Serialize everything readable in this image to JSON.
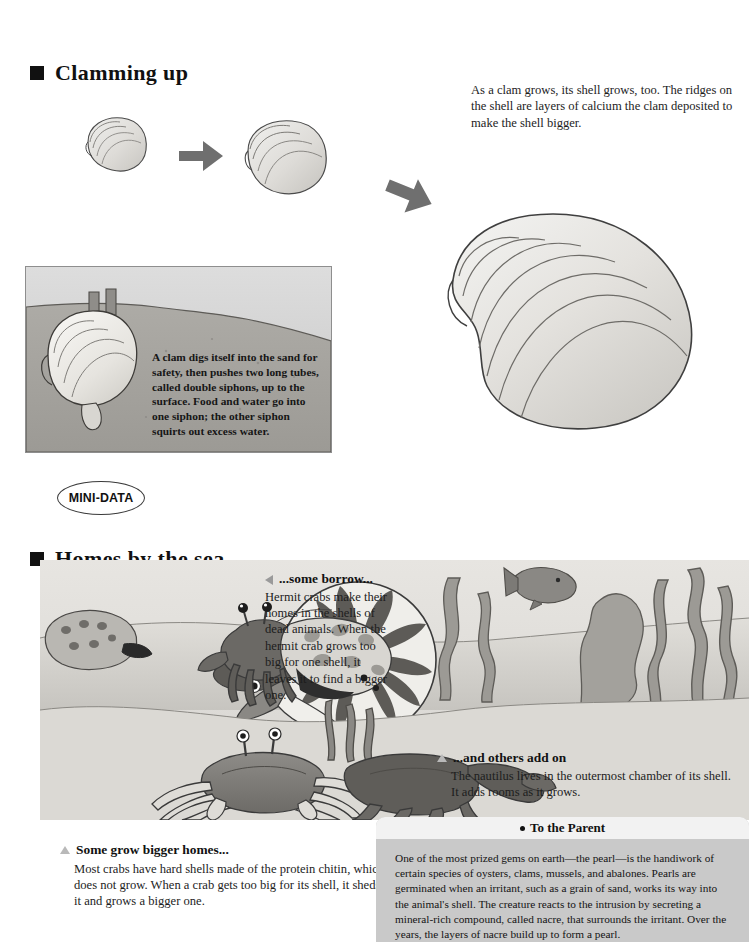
{
  "sections": {
    "clamming": {
      "title": "Clamming up",
      "bullet_icon": "square-bullet",
      "description": "As a clam grows, its shell grows, too. The ridges on the shell are layers of calcium the clam deposited to make the shell bigger.",
      "sand_caption": "A clam digs itself into the sand for safety, then pushes two long tubes, called double siphons, up to the surface. Food and water go into one siphon; the other siphon squirts out excess water."
    },
    "mini_data": {
      "label": "MINI-DATA"
    },
    "homes": {
      "title": "Homes by the sea",
      "bullet_icon": "square-bullet",
      "callouts": [
        {
          "marker": "triangle-left",
          "head": "...some borrow...",
          "body": "Hermit crabs make their homes in the shells of dead animals. When the hermit crab grows too big for one shell, it leaves it to find a bigger one."
        },
        {
          "marker": "triangle-up",
          "head": "...and others add on",
          "body": "The nautilus lives in the outermost chamber of its shell. It adds rooms as it grows."
        },
        {
          "marker": "triangle-up",
          "head": "Some grow bigger homes...",
          "body": "Most crabs have hard shells made of the protein chitin, which does not grow. When a crab gets too big for its shell, it sheds it and grows a bigger one."
        }
      ]
    },
    "parent": {
      "title": "To the Parent",
      "bullet_icon": "dot-bullet",
      "body": "One of the most prized gems on earth—the pearl—is the handiwork of certain species of oysters, clams, mussels, and abalones. Pearls are germinated when an irritant, such as a grain of sand, works its way into the animal's shell. The creature reacts to the intrusion by secreting a mineral-rich compound, called nacre, that surrounds the irritant. Over the years, the layers of nacre build up to form a pearl."
    }
  },
  "illustrations": {
    "clam_small": "small-clam-shell",
    "clam_medium": "medium-clam-shell",
    "clam_large": "large-clam-shell",
    "arrow_1": "arrow-right-down",
    "arrow_2": "arrow-right-down",
    "sand_panel": "clam-buried-in-sand-with-siphons",
    "sea_scene": "seafloor-with-hermit-crabs-crabs-nautilus-seaweed-fish"
  },
  "colors": {
    "ink": "#111111",
    "arrow": "#6f6f6f",
    "shell_fill": "#e2e2e0",
    "shell_line": "#4a4a4a",
    "sand_light": "#d9d7d3",
    "sand_dark": "#a8a5a0",
    "water": "#cfcfcf",
    "parent_box": "#c9c9c9",
    "parent_head": "#f2f2f2",
    "marker_gray": "#9a9a9a"
  }
}
